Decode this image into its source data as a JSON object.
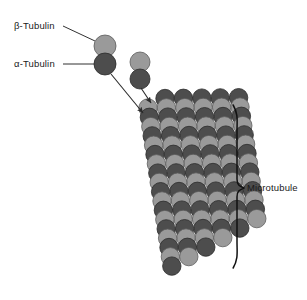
{
  "figure": {
    "background_color": "#ffffff",
    "width": 307,
    "height": 300
  },
  "colors": {
    "beta_tubulin_light_gray": "#9a9a9a",
    "alpha_tubulin_dark_gray": "#4d4d4d",
    "subunit_outline": "#2b2b2b",
    "label_text": "#1a1a1a",
    "leader_line": "#1a1a1a",
    "arrow": "#2a2a2a",
    "brace": "#111111"
  },
  "labels": {
    "beta_tubulin": "β-Tubulin",
    "alpha_tubulin": "α-Tubulin",
    "microtubule": "Microtubule"
  },
  "legend_dimer": {
    "description": "Free tubulin heterodimer with callout labels",
    "beta_subunit": {
      "cx": 105,
      "cy": 46,
      "r": 11,
      "shade": "light"
    },
    "alpha_subunit": {
      "cx": 105,
      "cy": 64,
      "r": 11,
      "shade": "dark"
    }
  },
  "free_dimer": {
    "description": "Unattached tubulin heterodimer approaching the plus end",
    "beta_subunit": {
      "cx": 140,
      "cy": 62,
      "r": 10,
      "shade": "light"
    },
    "alpha_subunit": {
      "cx": 140,
      "cy": 79,
      "r": 10,
      "shade": "dark"
    }
  },
  "arrows": [
    {
      "name": "dimer-incorporation-arrow-long",
      "x1": 111,
      "y1": 74,
      "x2": 143,
      "y2": 113
    },
    {
      "name": "dimer-incorporation-arrow-short",
      "x1": 141,
      "y1": 88,
      "x2": 151,
      "y2": 103
    }
  ],
  "leader_lines": [
    {
      "name": "beta-tubulin-leader",
      "x1": 63,
      "y1": 26,
      "x2": 95,
      "y2": 41
    },
    {
      "name": "alpha-tubulin-leader",
      "x1": 63,
      "y1": 64,
      "x2": 95,
      "y2": 64
    }
  ],
  "brace": {
    "name": "microtubule-brace",
    "top_y": 105,
    "bottom_y": 268,
    "x": 237,
    "tip_y": 188,
    "label_x": 247,
    "label_y": 191
  },
  "lattice": {
    "description": "Helical tubulin lattice drawn as a staggered grid of alternating light (beta) and dark (alpha) subunits",
    "columns": 6,
    "rows": 18,
    "radius": 9.2,
    "col_spacing": 17.0,
    "row_spacing": 9.3,
    "origin_x": 148,
    "origin_y": 108,
    "column_rise": -9.5,
    "skew_x": 1.4,
    "checker_start": "light"
  },
  "chart_data": {
    "type": "diagram",
    "annotations": [
      "β-Tubulin",
      "α-Tubulin",
      "Microtubule"
    ]
  }
}
